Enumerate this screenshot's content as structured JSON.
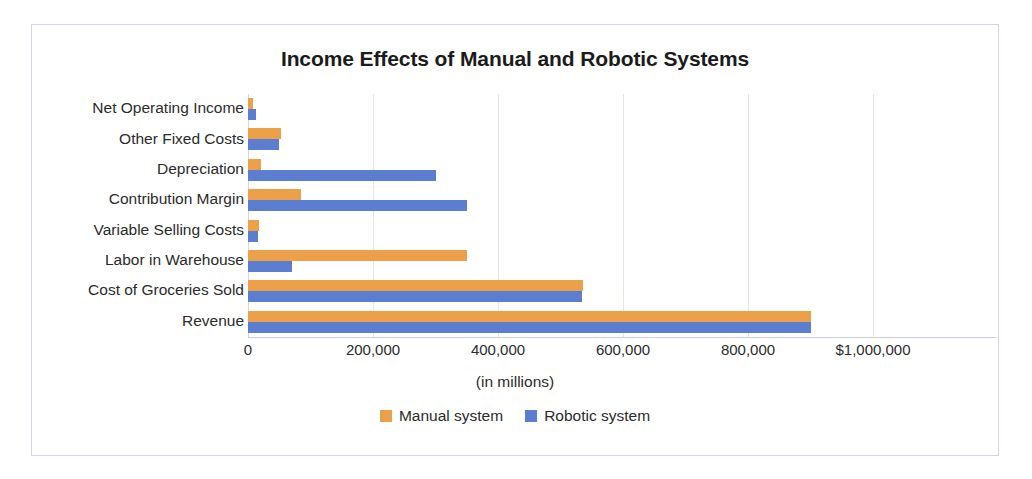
{
  "chart_data": {
    "type": "bar",
    "orientation": "horizontal",
    "title": "Income Effects of Manual and Robotic Systems",
    "xlabel": "(in millions)",
    "ylabel": "",
    "xlim": [
      0,
      1000000
    ],
    "xticks": [
      0,
      200000,
      400000,
      600000,
      800000,
      1000000
    ],
    "xtick_labels": [
      "0",
      "200,000",
      "400,000",
      "600,000",
      "800,000",
      "$1,000,000"
    ],
    "grid": true,
    "legend_position": "bottom",
    "categories": [
      "Net Operating Income",
      "Other Fixed Costs",
      "Depreciation",
      "Contribution Margin",
      "Variable Selling Costs",
      "Labor in Warehouse",
      "Cost of Groceries Sold",
      "Revenue"
    ],
    "series": [
      {
        "name": "Manual system",
        "color": "#eda04a",
        "values": [
          8000,
          52000,
          21000,
          84000,
          18000,
          350000,
          536000,
          900000
        ]
      },
      {
        "name": "Robotic system",
        "color": "#5b7ed1",
        "values": [
          12000,
          50000,
          300000,
          350000,
          16000,
          70000,
          534000,
          900000
        ]
      }
    ]
  },
  "figure": {
    "background": "#ffffff",
    "border_color": "#cfd8e3"
  }
}
